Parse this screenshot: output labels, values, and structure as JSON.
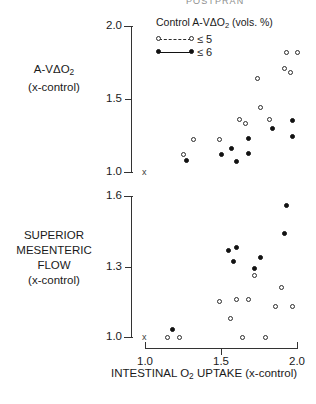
{
  "running_head": "POSTPRAN",
  "legend": {
    "title": "Control A-VΔO₂ (vols. %)",
    "entries": [
      {
        "marker": "open-circle-dashed",
        "label": "≤ 5"
      },
      {
        "marker": "filled-circle-solid",
        "label": "≤ 6"
      }
    ]
  },
  "panels": {
    "top": {
      "y_label_line1": "A-VΔO",
      "y_label_sub": "2",
      "y_label_line2": "(x-control)",
      "y_ticks": [
        "1.0",
        "1.5",
        "2.0"
      ],
      "origin_marker": "x"
    },
    "bottom": {
      "y_label_lines": [
        "SUPERIOR",
        "MESENTERIC",
        "FLOW",
        "(x-control)"
      ],
      "y_ticks": [
        "1.0",
        "1.3",
        "1.6"
      ],
      "origin_marker": "x"
    }
  },
  "x_axis": {
    "caption_line1": "INTESTINAL O",
    "caption_sub": "2",
    "caption_line1b": " UPTAKE",
    "caption_line2": "(x-control)",
    "ticks": [
      "1.0",
      "1.5",
      "2.0"
    ]
  },
  "chart_data": [
    {
      "type": "scatter",
      "title": "A-VΔO2 (x-control) vs Intestinal O2 uptake (x-control)",
      "xlabel": "INTESTINAL O2 UPTAKE (x-control)",
      "ylabel": "A-VΔO2 (x-control)",
      "xlim": [
        1.0,
        2.0
      ],
      "ylim": [
        1.0,
        2.0
      ],
      "xticks": [
        1.0,
        1.5,
        2.0
      ],
      "yticks": [
        1.0,
        1.5,
        2.0
      ],
      "grid": false,
      "legend_position": "top-center",
      "series": [
        {
          "name": "≤ 5",
          "marker": "open-circle",
          "points": [
            [
              1.25,
              1.12
            ],
            [
              1.32,
              1.22
            ],
            [
              1.49,
              1.22
            ],
            [
              1.62,
              1.36
            ],
            [
              1.66,
              1.33
            ],
            [
              1.76,
              1.44
            ],
            [
              1.74,
              1.64
            ],
            [
              1.82,
              1.36
            ],
            [
              1.93,
              1.82
            ],
            [
              1.96,
              1.68
            ],
            [
              1.92,
              1.71
            ],
            [
              2.0,
              1.82
            ]
          ]
        },
        {
          "name": "≤ 6",
          "marker": "filled-circle",
          "points": [
            [
              1.27,
              1.08
            ],
            [
              1.5,
              1.12
            ],
            [
              1.57,
              1.16
            ],
            [
              1.6,
              1.07
            ],
            [
              1.68,
              1.13
            ],
            [
              1.68,
              1.23
            ],
            [
              1.84,
              1.3
            ],
            [
              1.97,
              1.35
            ],
            [
              1.97,
              1.24
            ]
          ]
        }
      ]
    },
    {
      "type": "scatter",
      "title": "Superior mesenteric flow (x-control) vs Intestinal O2 uptake (x-control)",
      "xlabel": "INTESTINAL O2 UPTAKE (x-control)",
      "ylabel": "SUPERIOR MESENTERIC FLOW (x-control)",
      "xlim": [
        1.0,
        2.0
      ],
      "ylim": [
        1.0,
        1.6
      ],
      "xticks": [
        1.0,
        1.5,
        2.0
      ],
      "yticks": [
        1.0,
        1.3,
        1.6
      ],
      "grid": false,
      "legend_position": "none",
      "series": [
        {
          "name": "≤ 5",
          "marker": "open-circle",
          "points": [
            [
              1.15,
              1.0
            ],
            [
              1.23,
              1.0
            ],
            [
              1.49,
              1.15
            ],
            [
              1.56,
              1.08
            ],
            [
              1.6,
              1.16
            ],
            [
              1.64,
              1.0
            ],
            [
              1.68,
              1.16
            ],
            [
              1.72,
              1.26
            ],
            [
              1.79,
              1.0
            ],
            [
              1.86,
              1.13
            ],
            [
              1.9,
              1.21
            ],
            [
              1.97,
              1.13
            ]
          ]
        },
        {
          "name": "≤ 6",
          "marker": "filled-circle",
          "points": [
            [
              1.18,
              1.03
            ],
            [
              1.55,
              1.37
            ],
            [
              1.58,
              1.32
            ],
            [
              1.6,
              1.38
            ],
            [
              1.72,
              1.29
            ],
            [
              1.76,
              1.34
            ],
            [
              1.92,
              1.44
            ],
            [
              1.93,
              1.56
            ]
          ]
        }
      ]
    }
  ]
}
